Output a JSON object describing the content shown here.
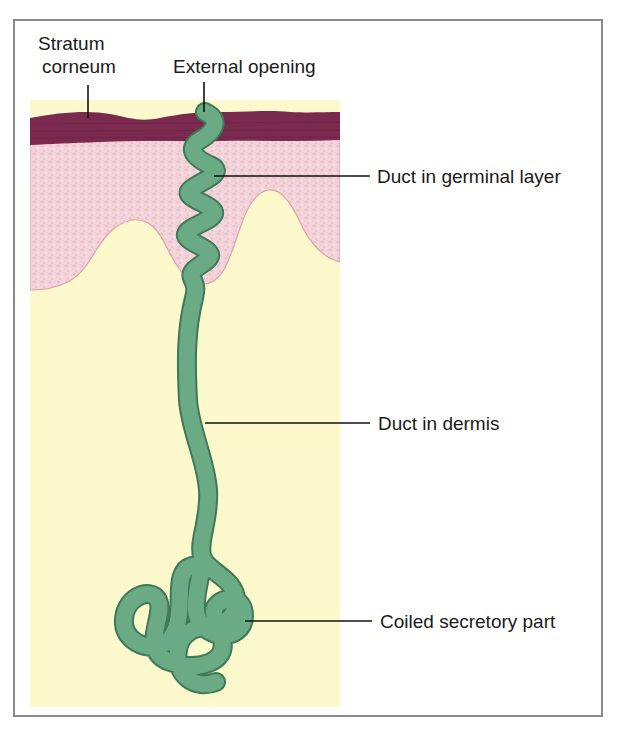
{
  "figure": {
    "labels": {
      "stratum_corneum_line1": "Stratum",
      "stratum_corneum_line2": "corneum",
      "external_opening": "External opening",
      "duct_germinal": "Duct in germinal layer",
      "duct_dermis": "Duct in dermis",
      "coiled_secretory": "Coiled secretory part"
    },
    "colors": {
      "stratum_corneum": "#7a2a4e",
      "germinal_layer": "#f3d3da",
      "dermis": "#fdf9cc",
      "duct_fill": "#6aaa84",
      "duct_outline": "#3d7a58",
      "coil_shadow": "#9a9a5a",
      "frame": "#8a8a8a"
    }
  }
}
